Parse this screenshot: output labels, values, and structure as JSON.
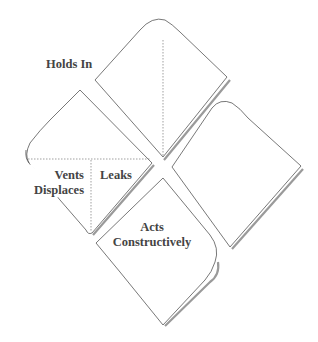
{
  "diagram": {
    "type": "four-quadrant diamond (curled paper) diagram",
    "panels": [
      {
        "id": "top",
        "label": "Holds In"
      },
      {
        "id": "left",
        "labels": [
          "Vents",
          "Displaces",
          "Leaks"
        ]
      },
      {
        "id": "right",
        "label": ""
      },
      {
        "id": "bottom",
        "label_lines": [
          "Acts",
          "Constructively"
        ]
      }
    ],
    "labels": {
      "holds_in": "Holds In",
      "vents": "Vents",
      "displaces": "Displaces",
      "leaks": "Leaks",
      "acts": "Acts",
      "constructively": "Constructively"
    },
    "colors": {
      "stroke": "#555555",
      "shadow": "#9a9a9a",
      "text": "#444444",
      "background": "#ffffff"
    }
  }
}
